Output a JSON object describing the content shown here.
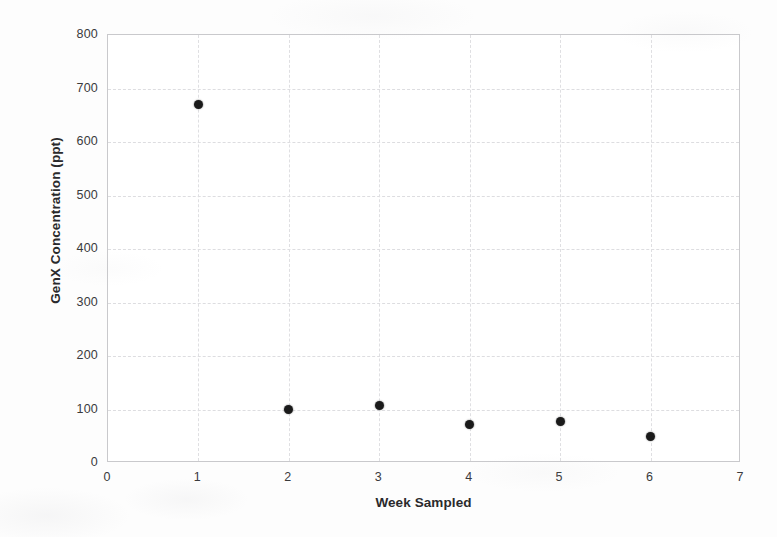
{
  "chart_data": {
    "type": "scatter",
    "title": "",
    "xlabel": "Week Sampled",
    "ylabel": "GenX Concentration (ppt)",
    "xlim": [
      0,
      7
    ],
    "ylim": [
      0,
      800
    ],
    "xticks": [
      "0",
      "1",
      "2",
      "3",
      "4",
      "5",
      "6",
      "7"
    ],
    "xtick_values": [
      0,
      1,
      2,
      3,
      4,
      5,
      6,
      7
    ],
    "yticks": [
      "0",
      "100",
      "200",
      "300",
      "400",
      "500",
      "600",
      "700",
      "800"
    ],
    "ytick_values": [
      0,
      100,
      200,
      300,
      400,
      500,
      600,
      700,
      800
    ],
    "grid": true,
    "legend": null,
    "marker": "filled-circle",
    "marker_color": "#1a1a1a",
    "x": [
      1,
      2,
      3,
      4,
      5,
      6
    ],
    "values": [
      670,
      100,
      107,
      72,
      78,
      50
    ],
    "points": [
      {
        "week": 1,
        "concentration": 670
      },
      {
        "week": 2,
        "concentration": 100
      },
      {
        "week": 3,
        "concentration": 107
      },
      {
        "week": 4,
        "concentration": 72
      },
      {
        "week": 5,
        "concentration": 78
      },
      {
        "week": 6,
        "concentration": 50
      }
    ]
  },
  "style": {
    "background": "#fdfdfd",
    "plot_background": "#ffffff",
    "grid_color": "#dddde0",
    "border_color": "#c9c9cc",
    "text_color": "#3a3a3c",
    "marker_color": "#1a1a1a"
  }
}
